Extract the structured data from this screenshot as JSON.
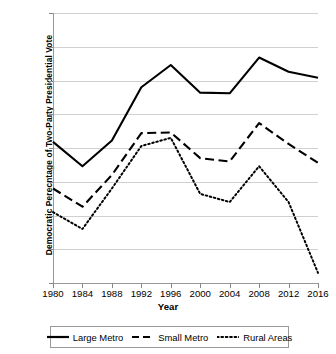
{
  "chart_data": {
    "type": "line",
    "title": "",
    "xlabel": "Year",
    "ylabel": "Democratic Perecntage of Two-Party Presidential Vote",
    "x": [
      1980,
      1984,
      1988,
      1992,
      1996,
      2000,
      2004,
      2008,
      2012,
      2016
    ],
    "xtick_labels": [
      "1980",
      "1984",
      "1988",
      "1992",
      "1996",
      "2000",
      "2004",
      "2008",
      "2012",
      "2016"
    ],
    "ytick_labels": [
      "70%",
      "65%",
      "60%",
      "55%",
      "50%",
      "45%",
      "40%",
      "35%",
      "30%"
    ],
    "ytick_values": [
      70,
      65,
      60,
      55,
      50,
      45,
      40,
      35,
      30
    ],
    "ylim": [
      30,
      70
    ],
    "xlim": [
      1980,
      2016
    ],
    "grid": true,
    "legend_position": "bottom",
    "series": [
      {
        "name": "Large Metro",
        "style": "solid",
        "color": "#000000",
        "values": [
          50.9,
          47.3,
          51.1,
          59.0,
          62.3,
          58.2,
          58.1,
          63.4,
          61.3,
          60.4
        ]
      },
      {
        "name": "Small Metro",
        "style": "dashed",
        "color": "#000000",
        "values": [
          44.0,
          41.3,
          46.0,
          52.2,
          52.3,
          48.5,
          48.0,
          53.7,
          50.6,
          47.8
        ]
      },
      {
        "name": "Rural Areas",
        "style": "dotted",
        "color": "#000000",
        "values": [
          40.5,
          38.0,
          44.0,
          50.3,
          51.5,
          43.2,
          42.0,
          47.3,
          42.0,
          31.5
        ]
      }
    ]
  },
  "legend": {
    "items": [
      {
        "label": "Large Metro",
        "style": "solid"
      },
      {
        "label": "Small Metro",
        "style": "dashed"
      },
      {
        "label": "Rural Areas",
        "style": "dotted"
      }
    ]
  },
  "axes": {
    "x_title": "Year",
    "y_title": "Democratic Perecntage of Two-Party Presidential Vote"
  }
}
